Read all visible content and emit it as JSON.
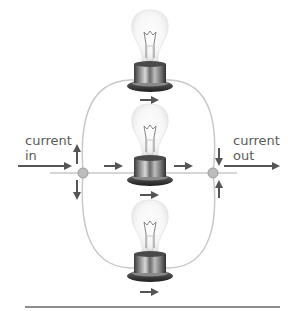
{
  "diagram": {
    "type": "parallel-circuit",
    "labels": {
      "current_in": "current\nin",
      "current_out": "current\nout"
    },
    "components": [
      {
        "id": "bulb-top",
        "kind": "light-bulb",
        "flow": "right"
      },
      {
        "id": "bulb-middle",
        "kind": "light-bulb",
        "flow": "right"
      },
      {
        "id": "bulb-bottom",
        "kind": "light-bulb",
        "flow": "right"
      }
    ],
    "junctions": [
      {
        "id": "junction-left",
        "role": "split"
      },
      {
        "id": "junction-right",
        "role": "merge"
      }
    ],
    "colors": {
      "wire": "#c8c8c8",
      "arrow": "#555555",
      "junction_fill": "#bdbdbd",
      "junction_stroke": "#9a9a9a",
      "text": "#5a5a5a",
      "rule": "#666666"
    }
  }
}
